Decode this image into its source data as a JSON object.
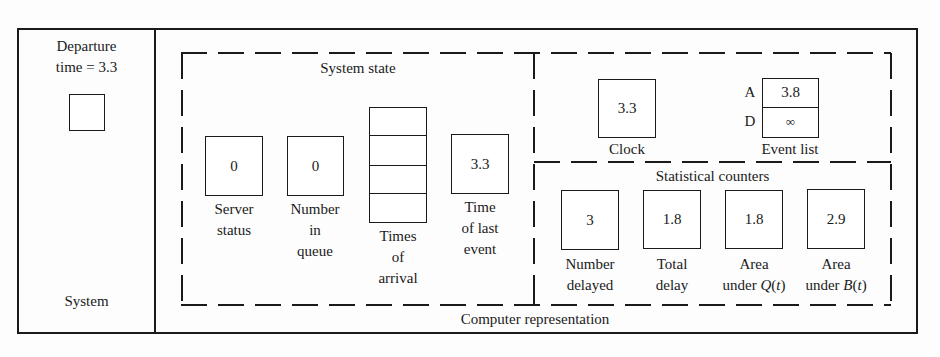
{
  "system": {
    "departure_label_line1": "Departure",
    "departure_label_line2": "time = 3.3",
    "footer": "System"
  },
  "computer_representation": {
    "footer": "Computer representation",
    "system_state": {
      "title": "System state",
      "server_status": {
        "value": "0",
        "label_line1": "Server",
        "label_line2": "status"
      },
      "number_in_queue": {
        "value": "0",
        "label_line1": "Number",
        "label_line2": "in",
        "label_line3": "queue"
      },
      "times_of_arrival": {
        "slots": [
          "",
          "",
          "",
          ""
        ],
        "label_line1": "Times",
        "label_line2": "of",
        "label_line3": "arrival"
      },
      "time_of_last_event": {
        "value": "3.3",
        "label_line1": "Time",
        "label_line2": "of last",
        "label_line3": "event"
      }
    },
    "clock": {
      "value": "3.3",
      "label": "Clock"
    },
    "event_list": {
      "label": "Event list",
      "entries": [
        {
          "key": "A",
          "value": "3.8"
        },
        {
          "key": "D",
          "value": "∞"
        }
      ]
    },
    "statistical_counters": {
      "title": "Statistical counters",
      "number_delayed": {
        "value": "3",
        "label_line1": "Number",
        "label_line2": "delayed"
      },
      "total_delay": {
        "value": "1.8",
        "label_line1": "Total",
        "label_line2": "delay"
      },
      "area_under_q": {
        "value": "1.8",
        "label_line1": "Area",
        "label_line2_prefix": "under ",
        "label_line2_fn": "Q",
        "label_line2_arg": "t"
      },
      "area_under_b": {
        "value": "2.9",
        "label_line1": "Area",
        "label_line2_prefix": "under ",
        "label_line2_fn": "B",
        "label_line2_arg": "t"
      }
    }
  }
}
